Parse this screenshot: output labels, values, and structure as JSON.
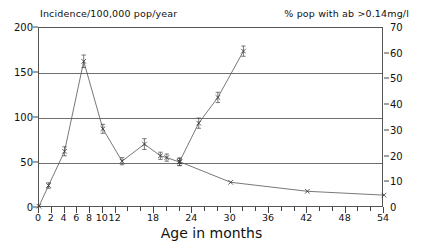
{
  "chart_data": {
    "type": "line",
    "title": "",
    "xlabel": "Age in months",
    "ylabel_left": "Incidence/100,000 pop/year",
    "ylabel_right": "% pop with ab >0.14mg/l",
    "xlim": [
      0,
      54
    ],
    "ylim_left": [
      0,
      200
    ],
    "ylim_right": [
      0,
      70
    ],
    "grid": true,
    "legend": "none",
    "xticks_major": [
      0,
      2,
      4,
      6,
      8,
      10,
      12,
      18,
      24,
      30,
      36,
      42,
      48,
      54
    ],
    "xtick_labels": [
      "0",
      "2",
      "4",
      "6",
      "8",
      "10",
      "12",
      "18",
      "24",
      "30",
      "36",
      "42",
      "48",
      "54"
    ],
    "xticks_minor_step": 2,
    "yticks_left": [
      0,
      50,
      100,
      150,
      200
    ],
    "ytick_labels_left": [
      "0",
      "50",
      "100",
      "150",
      "200"
    ],
    "yticks_right": [
      0,
      10,
      20,
      30,
      40,
      50,
      60,
      70
    ],
    "ytick_labels_right": [
      "0",
      "10",
      "20",
      "30",
      "40",
      "50",
      "60",
      "70"
    ],
    "gridlines_left": [
      50,
      100,
      150
    ],
    "series": [
      {
        "name": "Incidence/100,000 pop/year",
        "axis": "left",
        "marker": "x",
        "x": [
          0,
          1.5,
          4,
          7,
          10,
          13,
          16.5,
          19,
          20,
          22
        ],
        "values": [
          2,
          25,
          63,
          163,
          88,
          52,
          71,
          58,
          56,
          51
        ],
        "errors": [
          0,
          3,
          5,
          7,
          5,
          4,
          6,
          4,
          4,
          4
        ]
      },
      {
        "name": "% pop with ab >0.14mg/l (rising)",
        "axis": "right",
        "marker": "x",
        "x": [
          22,
          25,
          28,
          32
        ],
        "values": [
          18,
          33,
          43,
          61
        ],
        "errors": [
          1.5,
          2,
          2,
          2
        ]
      },
      {
        "name": "% pop with ab >0.14mg/l (declining)",
        "axis": "right",
        "marker": "x",
        "x": [
          22,
          30,
          42,
          54
        ],
        "values": [
          18,
          10,
          6.5,
          5
        ],
        "errors": [
          0,
          0,
          0,
          0
        ]
      }
    ]
  },
  "colors": {
    "line": "#555555",
    "grid": "#6f6f6f",
    "axis": "#444444",
    "text": "#111111",
    "background": "#ffffff"
  }
}
